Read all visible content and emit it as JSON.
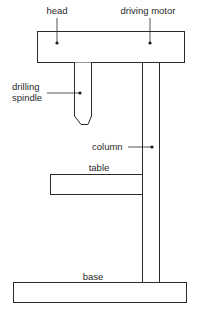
{
  "diagram": {
    "labels": {
      "head": "head",
      "driving_motor": "driving motor",
      "drilling_spindle_line1": "drilling",
      "drilling_spindle_line2": "spindle",
      "column": "column",
      "table": "table",
      "base": "base"
    },
    "parts": [
      "head",
      "driving motor",
      "drilling spindle",
      "column",
      "table",
      "base"
    ],
    "colors": {
      "stroke": "#2a2a2a",
      "background": "#ffffff"
    }
  }
}
